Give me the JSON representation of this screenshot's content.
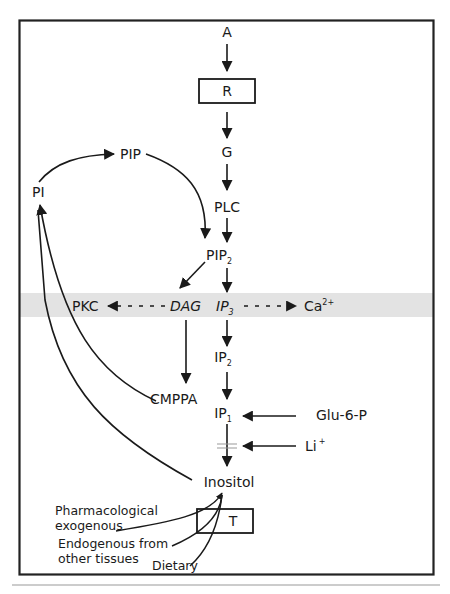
{
  "diagram": {
    "type": "signal-transduction-pathway",
    "colors": {
      "line": "#1a1a1a",
      "border": "#222222",
      "membrane_band": "#e3e3e3",
      "footer_rule": "#9a9a9a",
      "background": "#ffffff"
    },
    "main_chain": {
      "agonist": "A",
      "receptor": "R",
      "g_protein": "G",
      "plc": "PLC",
      "pip2": {
        "base": "PIP",
        "sub": "2"
      },
      "ip3": {
        "base": "IP",
        "sub": "3"
      },
      "ip2": {
        "base": "IP",
        "sub": "2"
      },
      "ip1": {
        "base": "IP",
        "sub": "1"
      },
      "inositol": "Inositol"
    },
    "recycling": {
      "pi": "PI",
      "pip": "PIP",
      "cmppa": "CMPPA"
    },
    "membrane_band": {
      "pkc": "PKC",
      "dag": "DAG",
      "ca": {
        "base": "Ca",
        "sup": "2+"
      }
    },
    "inputs": {
      "glu6p": "Glu-6-P",
      "li": {
        "base": "Li",
        "sup": "+"
      }
    },
    "transport": {
      "box_label": "T",
      "sources": {
        "pharmacological_line1": "Pharmacological",
        "pharmacological_line2": "exogenous",
        "endogenous_line1": "Endogenous from",
        "endogenous_line2": "other tissues",
        "dietary": "Dietary"
      }
    }
  }
}
